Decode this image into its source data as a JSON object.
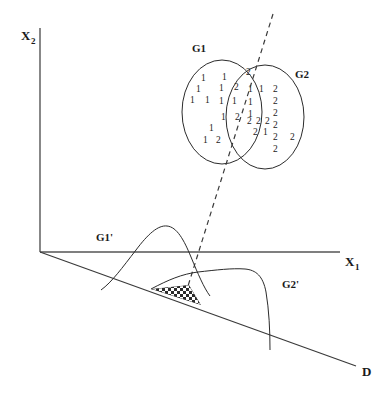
{
  "figure": {
    "background_color": "#ffffff",
    "line_color": "#2b2b2b",
    "axis_color": "#555555"
  },
  "axes": {
    "vertical": {
      "label": "X",
      "subscript": "2",
      "name": "x2-axis"
    },
    "horizontal": {
      "label": "X",
      "subscript": "1",
      "name": "x1-axis"
    },
    "discriminant": {
      "label": "D",
      "name": "d-axis"
    }
  },
  "groups": [
    {
      "id": "g1",
      "label": "G1",
      "member_symbol": "1"
    },
    {
      "id": "g2",
      "label": "G2",
      "member_symbol": "2"
    }
  ],
  "projected_groups": [
    {
      "id": "g1p",
      "label": "G1'"
    },
    {
      "id": "g2p",
      "label": "G2'"
    }
  ],
  "scatter_points": [
    {
      "v": "1",
      "x": 201,
      "y": 81
    },
    {
      "v": "1",
      "x": 222,
      "y": 80
    },
    {
      "v": "2",
      "x": 246,
      "y": 75
    },
    {
      "v": "1",
      "x": 196,
      "y": 92
    },
    {
      "v": "1",
      "x": 219,
      "y": 91
    },
    {
      "v": "2",
      "x": 234,
      "y": 90
    },
    {
      "v": "1",
      "x": 248,
      "y": 92
    },
    {
      "v": "1",
      "x": 259,
      "y": 92
    },
    {
      "v": "1",
      "x": 190,
      "y": 103
    },
    {
      "v": "1",
      "x": 205,
      "y": 103
    },
    {
      "v": "1",
      "x": 219,
      "y": 104
    },
    {
      "v": "1",
      "x": 232,
      "y": 104
    },
    {
      "v": "1",
      "x": 248,
      "y": 105
    },
    {
      "v": "2",
      "x": 273,
      "y": 92
    },
    {
      "v": "2",
      "x": 273,
      "y": 104
    },
    {
      "v": "1",
      "x": 248,
      "y": 117
    },
    {
      "v": "2",
      "x": 273,
      "y": 116
    },
    {
      "v": "1",
      "x": 221,
      "y": 120
    },
    {
      "v": "2",
      "x": 235,
      "y": 120
    },
    {
      "v": "2",
      "x": 247,
      "y": 124
    },
    {
      "v": "2",
      "x": 256,
      "y": 124
    },
    {
      "v": "2",
      "x": 265,
      "y": 124
    },
    {
      "v": "2",
      "x": 273,
      "y": 128
    },
    {
      "v": "1",
      "x": 209,
      "y": 131
    },
    {
      "v": "2",
      "x": 253,
      "y": 135
    },
    {
      "v": "1",
      "x": 263,
      "y": 135
    },
    {
      "v": "2",
      "x": 273,
      "y": 140
    },
    {
      "v": "2",
      "x": 290,
      "y": 140
    },
    {
      "v": "1",
      "x": 203,
      "y": 143
    },
    {
      "v": "2",
      "x": 216,
      "y": 143
    },
    {
      "v": "2",
      "x": 273,
      "y": 152
    }
  ],
  "regions": {
    "overlap": {
      "name": "misclassification-overlap-region",
      "fill_pattern": "checkerboard"
    }
  }
}
